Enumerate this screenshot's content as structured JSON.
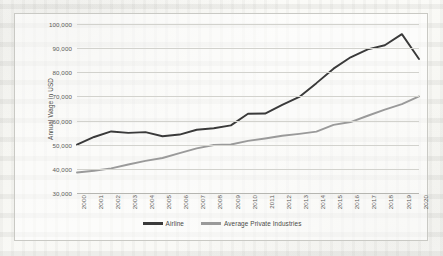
{
  "chart_data": {
    "type": "line",
    "title": "",
    "xlabel": "",
    "ylabel": "Annual Wage in USD",
    "categories": [
      "2000",
      "2001",
      "2002",
      "2003",
      "2004",
      "2005",
      "2006",
      "2007",
      "2008",
      "2009",
      "2010",
      "2011",
      "2012",
      "2013",
      "2014",
      "2015",
      "2016",
      "2017",
      "2018",
      "2019",
      "2020"
    ],
    "ylim": [
      30000,
      100000
    ],
    "yticks": [
      "30,000",
      "40,000",
      "50,000",
      "60,000",
      "70,000",
      "80,000",
      "90,000",
      "100,000"
    ],
    "ytick_values": [
      30000,
      40000,
      50000,
      60000,
      70000,
      80000,
      90000,
      100000
    ],
    "grid": true,
    "legend_position": "bottom",
    "series": [
      {
        "name": "Airline",
        "color": "#3a3a3a",
        "values": [
          50000,
          53200,
          55500,
          54900,
          55200,
          53500,
          54200,
          56200,
          56800,
          58000,
          62800,
          62900,
          66500,
          69800,
          75500,
          81500,
          86200,
          89500,
          91200,
          95800,
          85500
        ]
      },
      {
        "name": "Average Private Industries",
        "color": "#9a9a9a",
        "values": [
          38500,
          39200,
          40200,
          41800,
          43300,
          44500,
          46500,
          48500,
          49900,
          50100,
          51600,
          52600,
          53700,
          54500,
          55400,
          58200,
          59400,
          62000,
          64500,
          66800,
          70000
        ]
      }
    ]
  },
  "legend": {
    "items": [
      {
        "label": "Airline",
        "color": "#3a3a3a"
      },
      {
        "label": "Average Private Industries",
        "color": "#9a9a9a"
      }
    ]
  }
}
